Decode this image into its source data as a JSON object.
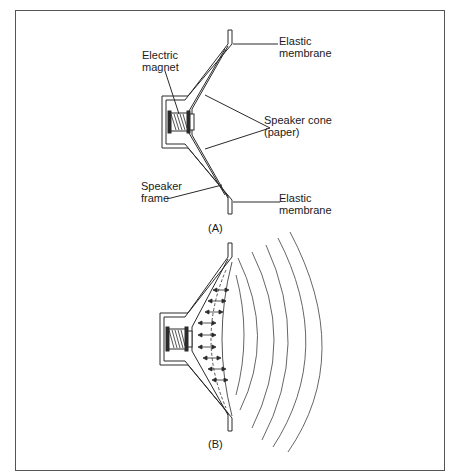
{
  "figure": {
    "panel_a": {
      "caption": "(A)",
      "labels": {
        "electric_magnet_line1": "Electric",
        "electric_magnet_line2": "magnet",
        "elastic_membrane_top_line1": "Elastic",
        "elastic_membrane_top_line2": "membrane",
        "speaker_cone_line1": "Speaker cone",
        "speaker_cone_line2": "(paper)",
        "speaker_frame_line1": "Speaker",
        "speaker_frame_line2": "frame",
        "elastic_membrane_bottom_line1": "Elastic",
        "elastic_membrane_bottom_line2": "membrane"
      }
    },
    "panel_b": {
      "caption": "(B)",
      "sound_wave_count": 5
    },
    "colors": {
      "line": "#2a2a2a",
      "wave": "#555555",
      "border": "#555555",
      "background": "#ffffff"
    }
  }
}
